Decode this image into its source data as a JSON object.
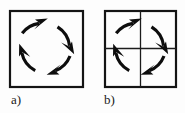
{
  "figure": {
    "type": "diagram",
    "background_color": "#fdfdfd",
    "stroke_color": "#101010",
    "panels": [
      {
        "id": "a",
        "label": "a)",
        "square": {
          "x": 9,
          "y": 10,
          "width": 75,
          "height": 78
        },
        "border_width": 2,
        "has_cross": false,
        "circle": {
          "cx": 46.5,
          "cy": 48,
          "r": 26
        },
        "rotation_direction": "clockwise",
        "arrow_count": 4,
        "arrows": [
          {
            "name": "top-left-arrow",
            "start_angle": 200,
            "end_angle": 288,
            "head_direction": "up-right"
          },
          {
            "name": "right-arrow",
            "start_angle": 290,
            "end_angle": 378,
            "head_direction": "down-right"
          },
          {
            "name": "bottom-right-arrow",
            "start_angle": 20,
            "end_angle": 108,
            "head_direction": "down-left"
          },
          {
            "name": "left-arrow",
            "start_angle": 110,
            "end_angle": 198,
            "head_direction": "up-left"
          }
        ]
      },
      {
        "id": "b",
        "label": "b)",
        "square": {
          "x": 104,
          "y": 10,
          "width": 73,
          "height": 78
        },
        "border_width": 2,
        "has_cross": true,
        "cross": {
          "vertical_x": 140.5,
          "horizontal_y": 48.5,
          "line_width": 1.2
        },
        "circle": {
          "cx": 140.5,
          "cy": 48,
          "r": 26
        },
        "rotation_direction": "clockwise",
        "arrow_count": 4,
        "arrows": [
          {
            "name": "top-left-arrow",
            "start_angle": 200,
            "end_angle": 288,
            "head_direction": "up-right"
          },
          {
            "name": "right-arrow",
            "start_angle": 290,
            "end_angle": 378,
            "head_direction": "down-right"
          },
          {
            "name": "bottom-right-arrow",
            "start_angle": 20,
            "end_angle": 108,
            "head_direction": "down-left"
          },
          {
            "name": "left-arrow",
            "start_angle": 110,
            "end_angle": 198,
            "head_direction": "up-left"
          }
        ]
      }
    ]
  }
}
